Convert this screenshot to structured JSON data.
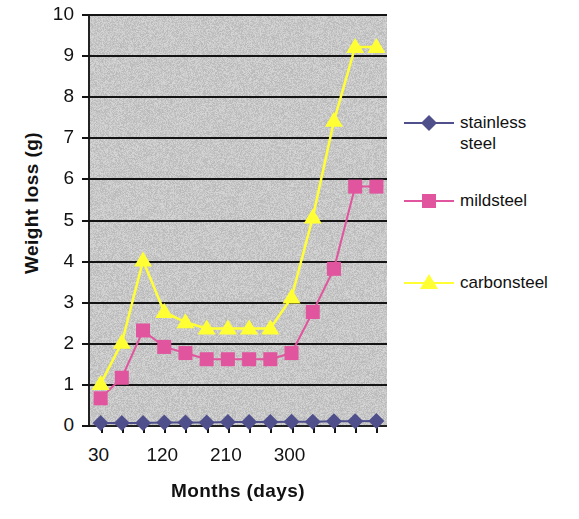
{
  "chart_data": {
    "type": "line",
    "title": "",
    "xlabel": "Months (days)",
    "ylabel": "Weight loss (g)",
    "x": [
      30,
      60,
      90,
      120,
      150,
      180,
      210,
      240,
      270,
      300,
      330,
      360,
      390,
      420
    ],
    "xtick_labels": [
      "30",
      "120",
      "210",
      "300"
    ],
    "xtick_values": [
      30,
      120,
      210,
      300
    ],
    "ytick_labels": [
      "0",
      "1",
      "2",
      "3",
      "4",
      "5",
      "6",
      "7",
      "8",
      "9",
      "10"
    ],
    "ylim": [
      0,
      10
    ],
    "xlim": [
      15,
      435
    ],
    "grid": "horizontal",
    "legend_position": "right",
    "plot_background": "#c8c8c8",
    "series": [
      {
        "name": "stainless\nsteel",
        "label": "stainless\nsteel",
        "color": "#4f4f8c",
        "marker": "diamond",
        "values": [
          0.05,
          0.05,
          0.05,
          0.06,
          0.06,
          0.06,
          0.07,
          0.07,
          0.07,
          0.08,
          0.08,
          0.09,
          0.09,
          0.1
        ]
      },
      {
        "name": "mildsteel",
        "label": "mildsteel",
        "color": "#e0559d",
        "marker": "square",
        "values": [
          0.65,
          1.15,
          2.3,
          1.9,
          1.75,
          1.6,
          1.6,
          1.6,
          1.6,
          1.75,
          2.75,
          3.8,
          5.8,
          5.8
        ]
      },
      {
        "name": "carbonsteel",
        "label": "carbonsteel",
        "color": "#ffff33",
        "marker": "triangle",
        "values": [
          1.0,
          2.0,
          4.0,
          2.75,
          2.5,
          2.35,
          2.35,
          2.35,
          2.35,
          3.1,
          5.05,
          7.4,
          9.2,
          9.2
        ]
      }
    ]
  },
  "axes": {
    "y_title": "Weight loss (g)",
    "x_title": "Months (days)"
  },
  "legend": {
    "items": [
      {
        "label": "stainless\nsteel",
        "color": "#4f4f8c",
        "marker": "diamond"
      },
      {
        "label": "mildsteel",
        "color": "#e0559d",
        "marker": "square"
      },
      {
        "label": "carbonsteel",
        "color": "#ffff33",
        "marker": "triangle"
      }
    ]
  }
}
